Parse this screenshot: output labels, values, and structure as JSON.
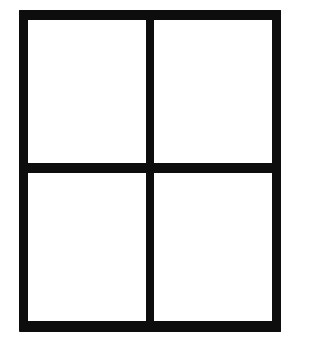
{
  "diagram": {
    "type": "window-grid",
    "rows": 2,
    "columns": 2,
    "line_color": "#0d0d0d",
    "background_color": "#ffffff",
    "panes": [
      {
        "row": 1,
        "col": 1
      },
      {
        "row": 1,
        "col": 2
      },
      {
        "row": 2,
        "col": 1
      },
      {
        "row": 2,
        "col": 2
      }
    ]
  }
}
